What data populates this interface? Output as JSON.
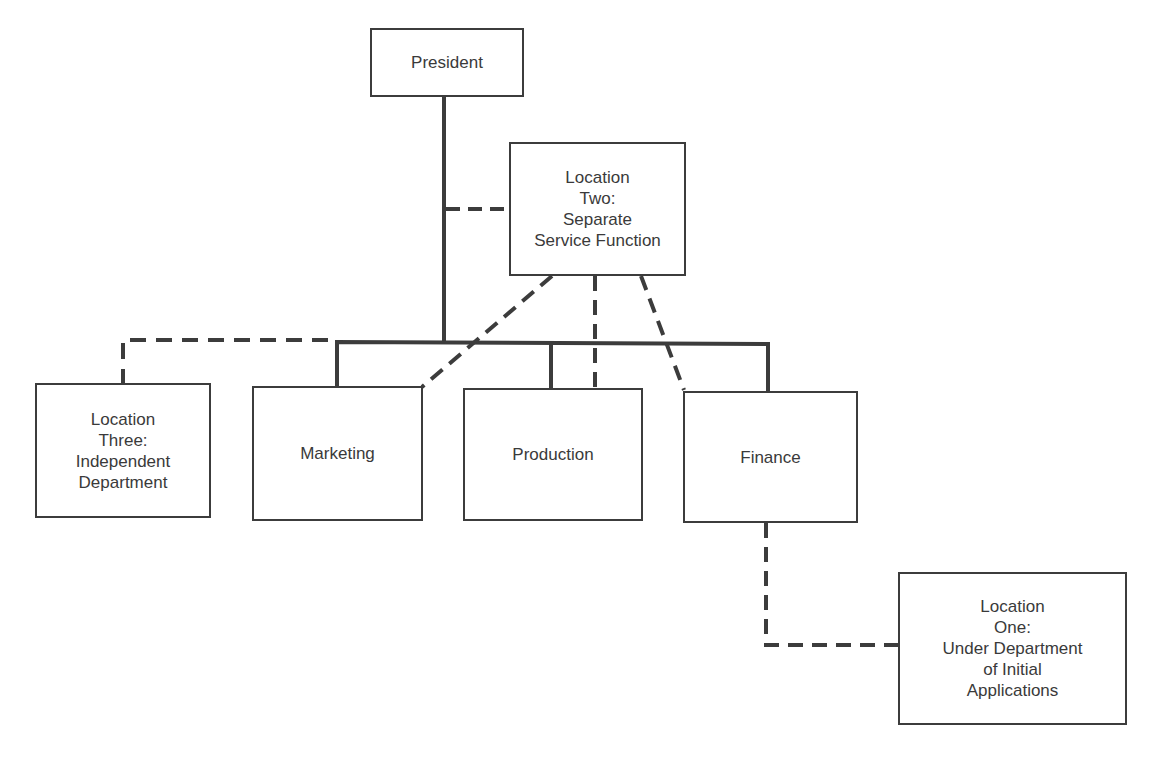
{
  "diagram": {
    "type": "organization-chart",
    "colors": {
      "line": "#3c3c3c",
      "box_border": "#3c3c3c",
      "text": "#3a3a3a",
      "background": "#ffffff"
    },
    "legend_semantics": {
      "solid_line": "line authority",
      "dashed_line": "possible location of service function"
    },
    "nodes": {
      "president": {
        "label": "President"
      },
      "location_two": {
        "label": "Location\nTwo:\nSeparate\nService Function"
      },
      "location_three": {
        "label": "Location\nThree:\nIndependent\nDepartment"
      },
      "marketing": {
        "label": "Marketing"
      },
      "production": {
        "label": "Production"
      },
      "finance": {
        "label": "Finance"
      },
      "location_one": {
        "label": "Location\nOne:\nUnder Department\nof Initial\nApplications"
      }
    },
    "edges": [
      {
        "from": "president",
        "to": "marketing",
        "style": "solid"
      },
      {
        "from": "president",
        "to": "production",
        "style": "solid"
      },
      {
        "from": "president",
        "to": "finance",
        "style": "solid"
      },
      {
        "from": "president",
        "to": "location_two",
        "style": "dashed"
      },
      {
        "from": "president",
        "to": "location_three",
        "style": "dashed"
      },
      {
        "from": "location_two",
        "to": "marketing",
        "style": "dashed"
      },
      {
        "from": "location_two",
        "to": "production",
        "style": "dashed"
      },
      {
        "from": "location_two",
        "to": "finance",
        "style": "dashed"
      },
      {
        "from": "finance",
        "to": "location_one",
        "style": "dashed"
      }
    ]
  }
}
